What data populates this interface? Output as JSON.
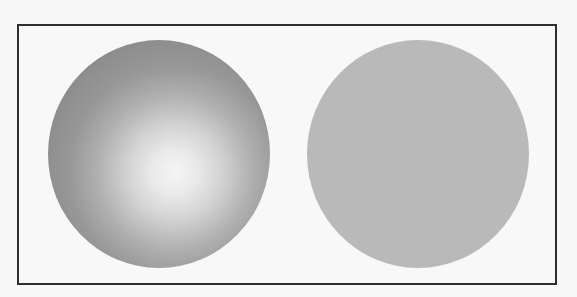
{
  "figure": {
    "left_shape": {
      "type": "shaded-sphere",
      "base_color": "#888888",
      "highlight_color": "#f4f4f4"
    },
    "right_shape": {
      "type": "flat-circle",
      "fill_color": "#b9b9b9"
    },
    "frame_color": "#2e2e2e",
    "background_color": "#f8f8f8"
  }
}
